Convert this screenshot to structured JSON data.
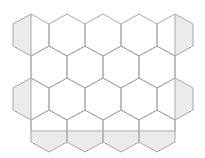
{
  "diagram": {
    "colors": {
      "background": "#ffffff",
      "line": "#a8a8a8",
      "shade": "#ebebeb"
    },
    "hexagon": {
      "orientation": "pointy-top",
      "half_width": 18,
      "top_to_side": 10,
      "top_to_lower_side": 32,
      "height": 42
    },
    "rows": [
      {
        "top_y": 14,
        "centers_x": [
          31,
          67,
          103,
          139,
          175
        ]
      },
      {
        "top_y": 46,
        "centers_x": [
          49,
          85,
          121,
          157
        ]
      },
      {
        "top_y": 78,
        "centers_x": [
          31,
          67,
          103,
          139,
          175
        ]
      },
      {
        "top_y": 110,
        "centers_x": [
          49,
          85,
          121,
          157
        ]
      }
    ],
    "rectangle": {
      "left_x": 31,
      "right_x": 175,
      "top_y": 14,
      "bottom_y": 131,
      "sides_drawn": [
        "left",
        "right",
        "bottom"
      ]
    },
    "shaded_regions": [
      "left half of row 1 first hexagon",
      "right half of row 1 last hexagon",
      "left half of row 3 first hexagon",
      "right half of row 3 last hexagon",
      "parts of row 4 hexagons below the rectangle bottom"
    ]
  }
}
